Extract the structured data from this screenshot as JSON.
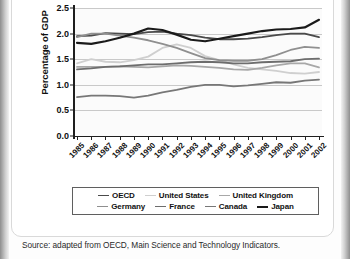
{
  "figure": {
    "source_note": "Source: adapted from OECD, Main Science and Technology Indicators."
  },
  "chart_data": {
    "type": "line",
    "title": "",
    "xlabel": "",
    "ylabel": "Percentage of GDP",
    "ylim": [
      0.0,
      2.5
    ],
    "ytick_labels": [
      "0.0",
      "0.5",
      "1.0",
      "1.5",
      "2.0",
      "2.5"
    ],
    "ytick_values": [
      0.0,
      0.5,
      1.0,
      1.5,
      2.0,
      2.5
    ],
    "grid": true,
    "legend_position": "below",
    "categories": [
      "1985",
      "1986",
      "1987",
      "1988",
      "1989",
      "1990",
      "1991",
      "1992",
      "1993",
      "1994",
      "1995",
      "1996",
      "1997",
      "1998",
      "1999",
      "2000",
      "2001",
      "2002"
    ],
    "series": [
      {
        "name": "OECD",
        "color": "#4a4a4a",
        "width": 1.8,
        "values": [
          1.95,
          1.96,
          2.01,
          2.0,
          1.99,
          2.03,
          2.04,
          2.0,
          1.97,
          1.92,
          1.89,
          1.89,
          1.9,
          1.93,
          1.97,
          2.0,
          2.0,
          1.93
        ]
      },
      {
        "name": "United States",
        "color": "#cfcfcf",
        "width": 1.8,
        "values": [
          1.42,
          1.5,
          1.45,
          1.44,
          1.48,
          1.55,
          1.72,
          1.79,
          1.72,
          1.56,
          1.48,
          1.4,
          1.33,
          1.3,
          1.27,
          1.23,
          1.22,
          1.25
        ]
      },
      {
        "name": "United Kingdom",
        "color": "#a8a8a8",
        "width": 1.8,
        "values": [
          1.35,
          1.35,
          1.35,
          1.36,
          1.35,
          1.34,
          1.36,
          1.38,
          1.37,
          1.35,
          1.33,
          1.3,
          1.29,
          1.33,
          1.38,
          1.42,
          1.42,
          1.34
        ]
      },
      {
        "name": "Germany",
        "color": "#8f8f8f",
        "width": 1.8,
        "values": [
          1.93,
          2.0,
          2.0,
          1.96,
          1.92,
          1.87,
          1.8,
          1.72,
          1.62,
          1.52,
          1.48,
          1.47,
          1.47,
          1.5,
          1.58,
          1.68,
          1.74,
          1.72
        ]
      },
      {
        "name": "France",
        "color": "#6d6d6d",
        "width": 1.8,
        "values": [
          1.3,
          1.32,
          1.35,
          1.36,
          1.38,
          1.4,
          1.4,
          1.42,
          1.44,
          1.45,
          1.44,
          1.42,
          1.42,
          1.44,
          1.45,
          1.46,
          1.5,
          1.51
        ]
      },
      {
        "name": "Canada",
        "color": "#777777",
        "width": 1.8,
        "values": [
          0.76,
          0.79,
          0.79,
          0.78,
          0.75,
          0.79,
          0.85,
          0.9,
          0.96,
          1.0,
          1.0,
          0.97,
          0.99,
          1.02,
          1.05,
          1.04,
          1.08,
          1.1
        ]
      },
      {
        "name": "Japan",
        "color": "#1a1a1a",
        "width": 2.2,
        "values": [
          1.82,
          1.8,
          1.85,
          1.92,
          2.0,
          2.1,
          2.07,
          1.98,
          1.88,
          1.85,
          1.9,
          1.95,
          2.0,
          2.05,
          2.08,
          2.09,
          2.12,
          2.27
        ]
      }
    ],
    "legend_rows": [
      [
        "OECD",
        "United States",
        "United Kingdom"
      ],
      [
        "Germany",
        "France",
        "Canada",
        "Japan"
      ]
    ]
  }
}
